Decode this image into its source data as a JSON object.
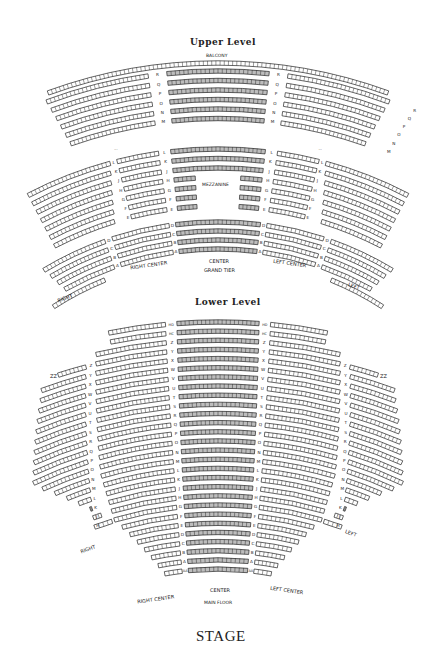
{
  "upper_level": {
    "title": "Upper Level",
    "balcony_label": "BALCONY",
    "balcony_rows": [
      "R",
      "Q",
      "P",
      "O",
      "N",
      "M"
    ],
    "grand_tier_side_rows": [
      "L",
      "K",
      "J",
      "H",
      "G",
      "F",
      "E"
    ],
    "mezzanine_label": "MEZZANINE",
    "mezzanine_rows": [
      "L",
      "K",
      "J",
      "H",
      "G",
      "F",
      "E"
    ],
    "grand_tier_rows": [
      "D",
      "C",
      "B",
      "A"
    ],
    "sections": {
      "right": "RIGHT",
      "right_center": "RIGHT CENTER",
      "center": "CENTER",
      "grand_tier": "GRAND TIER",
      "left_center": "LEFT CENTER",
      "left": "LEFT"
    }
  },
  "lower_level": {
    "title": "Lower Level",
    "center_rows": [
      "HD",
      "HC",
      "Z",
      "Y",
      "X",
      "W",
      "V",
      "U",
      "T",
      "S",
      "R",
      "Q",
      "P",
      "O",
      "N",
      "M",
      "L",
      "K",
      "J",
      "H",
      "G",
      "F",
      "E",
      "D",
      "C",
      "B",
      "A",
      "AA"
    ],
    "side_rows": [
      "Z",
      "Y",
      "X",
      "W",
      "V",
      "U",
      "T",
      "S",
      "R",
      "Q",
      "P",
      "O",
      "N",
      "M",
      "L",
      "K",
      "J",
      "H"
    ],
    "box_label": "ZZ",
    "sections": {
      "right": "RIGHT",
      "right_center": "RIGHT CENTER",
      "center": "CENTER",
      "main_floor": "MAIN FLOOR",
      "left_center": "LEFT CENTER",
      "left": "LEFT"
    }
  },
  "stage_label": "STAGE",
  "colors": {
    "seat_outline": "#222222",
    "seat_fill_center": "#bdbdbd",
    "seat_fill_side": "#ffffff",
    "background": "#ffffff"
  }
}
